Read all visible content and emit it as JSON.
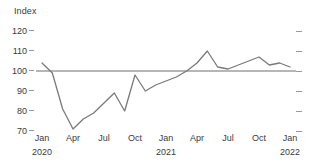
{
  "chart_data": {
    "type": "line",
    "title": "",
    "ylabel": "Index",
    "xlabel": "",
    "ylim": [
      65,
      123
    ],
    "yticks": [
      120,
      110,
      100,
      90,
      80,
      70
    ],
    "grid": false,
    "legend": "none",
    "reference_line": {
      "value": 100,
      "label": "100"
    },
    "x": [
      "Jan 2020",
      "Feb 2020",
      "Mar 2020",
      "Apr 2020",
      "May 2020",
      "Jun 2020",
      "Jul 2020",
      "Aug 2020",
      "Sep 2020",
      "Oct 2020",
      "Nov 2020",
      "Dec 2020",
      "Jan 2021",
      "Feb 2021",
      "Mar 2021",
      "Apr 2021",
      "May 2021",
      "Jun 2021",
      "Jul 2021",
      "Aug 2021",
      "Sep 2021",
      "Oct 2021",
      "Nov 2021",
      "Dec 2021",
      "Jan 2022"
    ],
    "values": [
      104,
      99,
      81,
      71,
      76,
      79,
      84,
      89,
      80,
      98,
      90,
      93,
      95,
      97,
      100,
      104,
      110,
      102,
      101,
      103,
      105,
      107,
      103,
      104,
      102
    ],
    "xticks": [
      {
        "month": "Jan",
        "year": "2020"
      },
      {
        "month": "Apr",
        "year": ""
      },
      {
        "month": "Jul",
        "year": ""
      },
      {
        "month": "Oct",
        "year": ""
      },
      {
        "month": "Jan",
        "year": "2021"
      },
      {
        "month": "Apr",
        "year": ""
      },
      {
        "month": "Jul",
        "year": ""
      },
      {
        "month": "Oct",
        "year": ""
      },
      {
        "month": "Jan",
        "year": "2022"
      }
    ],
    "series_color": "#7a7a7a",
    "reference_color": "#6e6e6e",
    "tick_color": "#9a9a9a"
  },
  "axis": {
    "y_title": "Index",
    "ticks_y": [
      "120",
      "110",
      "100",
      "90",
      "80",
      "70"
    ]
  }
}
